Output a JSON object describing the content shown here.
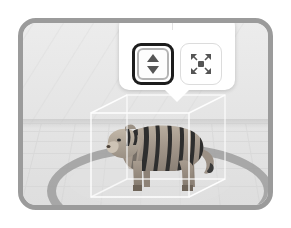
{
  "app": {
    "mode_label": "AR object placement",
    "viewport_label": "3D scene viewport"
  },
  "scene": {
    "model_name": "tiger",
    "model_label": "Tiger 3D model",
    "selection_label": "Selected object bounding box",
    "ground_label": "Ground placement ring",
    "grid_label": "Perspective grid floor",
    "frame_color": "#9b9b9b",
    "background_color": "#e8e8e8",
    "wireframe_color": "#ffffff",
    "ring_color": "#9d9d9d"
  },
  "toolbar": {
    "name": "object transform toolbar",
    "selected_tool_id": "move-vertical",
    "tools": [
      {
        "id": "move-vertical",
        "label": "Move up and down",
        "icon": "arrows-up-down-icon",
        "selected": true
      },
      {
        "id": "scale",
        "label": "Resize",
        "icon": "scale-arrows-icon",
        "selected": false
      }
    ],
    "selected_outline_color": "#1d1d1d",
    "icon_color": "#6b6b6b",
    "panel_color": "#ffffff"
  }
}
